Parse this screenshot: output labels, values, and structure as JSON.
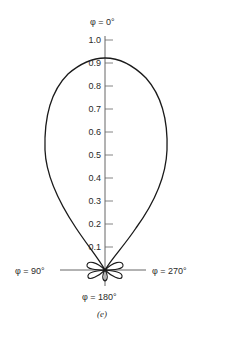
{
  "diagram": {
    "type": "polar-radiation-pattern",
    "caption": "(e)",
    "angle_labels": {
      "top": "φ = 0°",
      "left": "φ = 90°",
      "right": "φ = 270°",
      "bottom": "φ = 180°"
    },
    "radial_axis": {
      "ticks": [
        "1.0",
        "0.9",
        "0.8",
        "0.7",
        "0.6",
        "0.5",
        "0.4",
        "0.3",
        "0.2",
        "0.1"
      ],
      "range": [
        0,
        1.0
      ]
    },
    "main_lobe_peak": 0.92,
    "side_lobes": "four small minor lobes near origin",
    "stroke_color": "#1a1a1a"
  }
}
